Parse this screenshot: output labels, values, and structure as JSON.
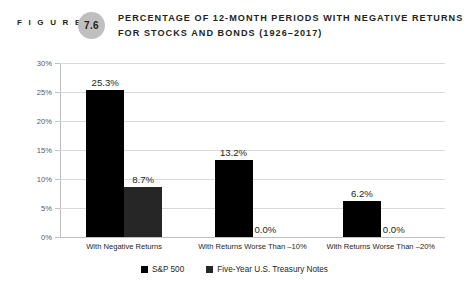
{
  "header": {
    "figure_word": "F I G U R E",
    "figure_number": "7.6",
    "title_line_1": "PERCENTAGE OF 12-MONTH PERIODS WITH NEGATIVE RETURNS",
    "title_line_2": "FOR STOCKS AND BONDS (1926–2017)",
    "badge_color": "#bfbfbf"
  },
  "chart_data": {
    "type": "bar",
    "title": "Percentage of 12-Month Periods with Negative Returns for Stocks and Bonds (1926–2017)",
    "xlabel": "",
    "ylabel": "",
    "ylim": [
      0,
      30
    ],
    "ytick_labels": [
      "0%",
      "5%",
      "10%",
      "15%",
      "20%",
      "25%",
      "30%"
    ],
    "ytick_values": [
      0,
      5,
      10,
      15,
      20,
      25,
      30
    ],
    "grid": true,
    "legend_position": "bottom",
    "categories": [
      "With Negative Returns",
      "With Returns Worse Than –10%",
      "With Returns Worse Than –20%"
    ],
    "series": [
      {
        "name": "S&P 500",
        "color": "#000000",
        "values": [
          25.3,
          13.2,
          6.2
        ],
        "labels": [
          "25.3%",
          "13.2%",
          "6.2%"
        ]
      },
      {
        "name": "Five-Year U.S. Treasury Notes",
        "color": "#262626",
        "values": [
          8.7,
          0.0,
          0.0
        ],
        "labels": [
          "8.7%",
          "0.0%",
          "0.0%"
        ]
      }
    ]
  }
}
